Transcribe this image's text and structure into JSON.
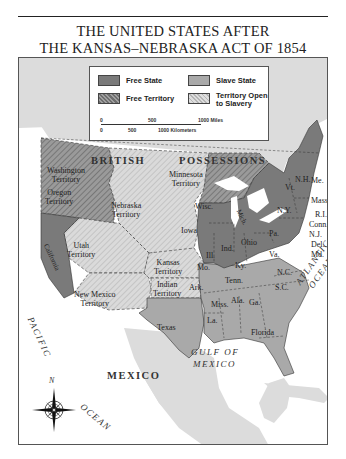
{
  "title": {
    "line1": "THE UNITED STATES AFTER",
    "line2": "THE KANSAS–NEBRASKA ACT OF 1854"
  },
  "legend": {
    "items": [
      {
        "label": "Free State",
        "pattern": "solid-dark",
        "color": "#7a7a7a"
      },
      {
        "label": "Slave State",
        "pattern": "solid-medium",
        "color": "#a9a9a9"
      },
      {
        "label": "Free Territory",
        "pattern": "hatched-dark",
        "color": "#8c8c8c"
      },
      {
        "label": "Territory Open to Slavery",
        "label_line1": "Territory Open",
        "label_line2": "to Slavery",
        "pattern": "hatched-light",
        "color": "#cfcfcf"
      }
    ],
    "scale": {
      "miles": {
        "ticks": [
          "0",
          "500",
          "1000 Miles"
        ]
      },
      "kilometers": {
        "ticks": [
          "0",
          "500",
          "1000 Kilometers"
        ]
      }
    }
  },
  "regions": {
    "british_possessions": "BRITISH POSSESSIONS",
    "british": "BRITISH",
    "possessions": "POSSESSIONS",
    "mexico": "MEXICO",
    "pacific": "PACIFIC",
    "pacific_ocean": "OCEAN",
    "atlantic": "ATLANTIC",
    "atlantic_ocean": "OCEAN",
    "gulf1": "GULF OF",
    "gulf2": "MEXICO"
  },
  "territories": {
    "washington": [
      "Washington",
      "Territory"
    ],
    "oregon": [
      "Oregon",
      "Territory"
    ],
    "nebraska": [
      "Nebraska",
      "Territory"
    ],
    "minnesota": [
      "Minnesota",
      "Territory"
    ],
    "utah": [
      "Utah",
      "Territory"
    ],
    "kansas": [
      "Kansas",
      "Territory"
    ],
    "indian": [
      "Indian",
      "Territory"
    ],
    "new_mexico": [
      "New Mexico",
      "Territory"
    ]
  },
  "states": {
    "free": [
      "California",
      "Iowa",
      "Wisc.",
      "Mich.",
      "Ill.",
      "Ind.",
      "Ohio",
      "Pa.",
      "N.Y.",
      "Vt.",
      "N.H.",
      "Me.",
      "Mass.",
      "R.I.",
      "Conn.",
      "N.J."
    ],
    "slave": [
      "Texas",
      "Mo.",
      "Ark.",
      "La.",
      "Ky.",
      "Tenn.",
      "Miss.",
      "Ala.",
      "Ga.",
      "Florida",
      "S.C.",
      "N.C.",
      "Va.",
      "Md.",
      "Del."
    ]
  },
  "compass": {
    "north_label": "N"
  },
  "colors": {
    "free_state": "#7a7a7a",
    "slave_state": "#a9a9a9",
    "free_territory": "#8c8c8c",
    "open_territory": "#cfcfcf",
    "foreign_land": "#dcdcdc",
    "water": "#ffffff"
  }
}
